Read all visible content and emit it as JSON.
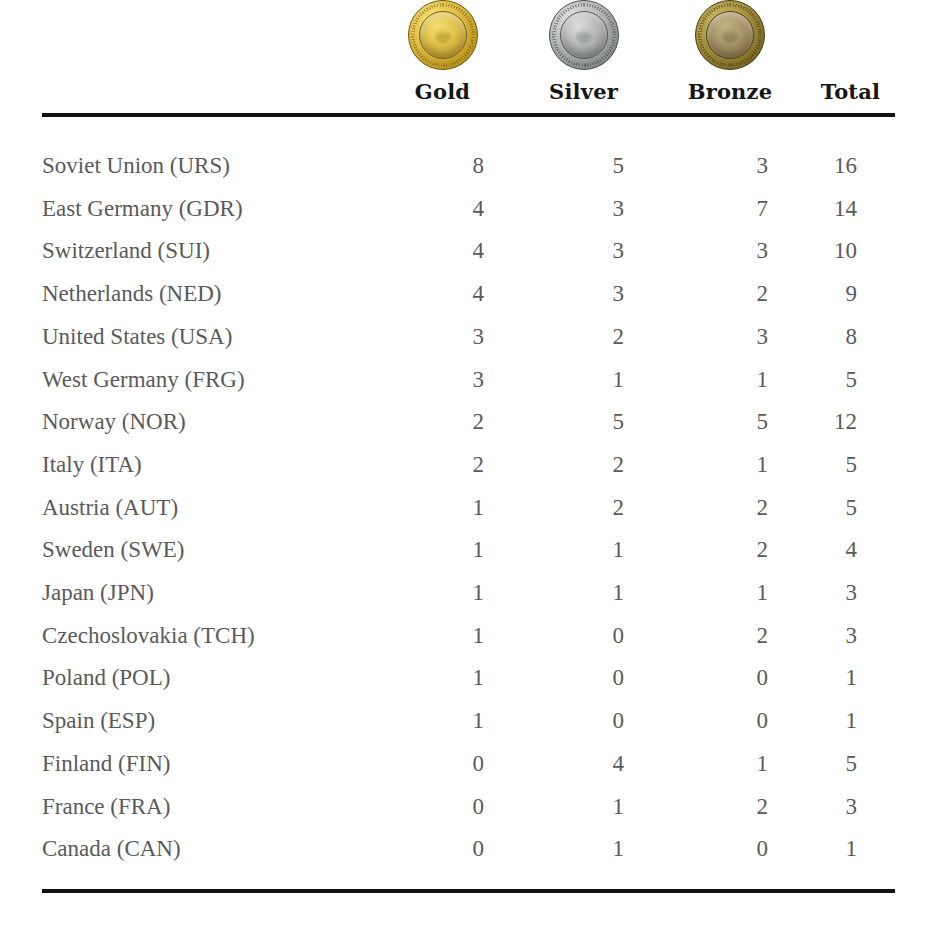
{
  "table": {
    "columns": [
      {
        "key": "country",
        "label": "",
        "icon": null,
        "align": "left"
      },
      {
        "key": "gold",
        "label": "Gold",
        "icon": "gold-medal-icon",
        "align": "right"
      },
      {
        "key": "silver",
        "label": "Silver",
        "icon": "silver-medal-icon",
        "align": "right"
      },
      {
        "key": "bronze",
        "label": "Bronze",
        "icon": "bronze-medal-icon",
        "align": "right"
      },
      {
        "key": "total",
        "label": "Total",
        "icon": null,
        "align": "right"
      }
    ],
    "rows": [
      {
        "country": "Soviet Union (URS)",
        "gold": "8",
        "silver": "5",
        "bronze": "3",
        "total": "16"
      },
      {
        "country": "East Germany (GDR)",
        "gold": "4",
        "silver": "3",
        "bronze": "7",
        "total": "14"
      },
      {
        "country": "Switzerland (SUI)",
        "gold": "4",
        "silver": "3",
        "bronze": "3",
        "total": "10"
      },
      {
        "country": "Netherlands (NED)",
        "gold": "4",
        "silver": "3",
        "bronze": "2",
        "total": "9"
      },
      {
        "country": "United States (USA)",
        "gold": "3",
        "silver": "2",
        "bronze": "3",
        "total": "8"
      },
      {
        "country": "West Germany (FRG)",
        "gold": "3",
        "silver": "1",
        "bronze": "1",
        "total": "5"
      },
      {
        "country": "Norway (NOR)",
        "gold": "2",
        "silver": "5",
        "bronze": "5",
        "total": "12"
      },
      {
        "country": "Italy (ITA)",
        "gold": "2",
        "silver": "2",
        "bronze": "1",
        "total": "5"
      },
      {
        "country": "Austria (AUT)",
        "gold": "1",
        "silver": "2",
        "bronze": "2",
        "total": "5"
      },
      {
        "country": "Sweden (SWE)",
        "gold": "1",
        "silver": "1",
        "bronze": "2",
        "total": "4"
      },
      {
        "country": "Japan (JPN)",
        "gold": "1",
        "silver": "1",
        "bronze": "1",
        "total": "3"
      },
      {
        "country": "Czechoslovakia (TCH)",
        "gold": "1",
        "silver": "0",
        "bronze": "2",
        "total": "3"
      },
      {
        "country": "Poland (POL)",
        "gold": "1",
        "silver": "0",
        "bronze": "0",
        "total": "1"
      },
      {
        "country": "Spain (ESP)",
        "gold": "1",
        "silver": "0",
        "bronze": "0",
        "total": "1"
      },
      {
        "country": "Finland (FIN)",
        "gold": "0",
        "silver": "4",
        "bronze": "1",
        "total": "5"
      },
      {
        "country": "France (FRA)",
        "gold": "0",
        "silver": "1",
        "bronze": "2",
        "total": "3"
      },
      {
        "country": "Canada (CAN)",
        "gold": "0",
        "silver": "1",
        "bronze": "0",
        "total": "1"
      }
    ]
  },
  "colors": {
    "rule": "#121212",
    "header_text": "#151515",
    "body_text": "#5a5a5a",
    "background": "#ffffff",
    "gold": "#e3c249",
    "silver": "#b9bcbc",
    "bronze": "#a89441"
  },
  "chart_data": {
    "type": "table",
    "title": "",
    "columns": [
      "",
      "Gold",
      "Silver",
      "Bronze",
      "Total"
    ],
    "rows": [
      [
        "Soviet Union (URS)",
        8,
        5,
        3,
        16
      ],
      [
        "East Germany (GDR)",
        4,
        3,
        7,
        14
      ],
      [
        "Switzerland (SUI)",
        4,
        3,
        3,
        10
      ],
      [
        "Netherlands (NED)",
        4,
        3,
        2,
        9
      ],
      [
        "United States (USA)",
        3,
        2,
        3,
        8
      ],
      [
        "West Germany (FRG)",
        3,
        1,
        1,
        5
      ],
      [
        "Norway (NOR)",
        2,
        5,
        5,
        12
      ],
      [
        "Italy (ITA)",
        2,
        2,
        1,
        5
      ],
      [
        "Austria (AUT)",
        1,
        2,
        2,
        5
      ],
      [
        "Sweden (SWE)",
        1,
        1,
        2,
        4
      ],
      [
        "Japan (JPN)",
        1,
        1,
        1,
        3
      ],
      [
        "Czechoslovakia (TCH)",
        1,
        0,
        2,
        3
      ],
      [
        "Poland (POL)",
        1,
        0,
        0,
        1
      ],
      [
        "Spain (ESP)",
        1,
        0,
        0,
        1
      ],
      [
        "Finland (FIN)",
        0,
        4,
        1,
        5
      ],
      [
        "France (FRA)",
        0,
        1,
        2,
        3
      ],
      [
        "Canada (CAN)",
        0,
        1,
        0,
        1
      ]
    ]
  }
}
